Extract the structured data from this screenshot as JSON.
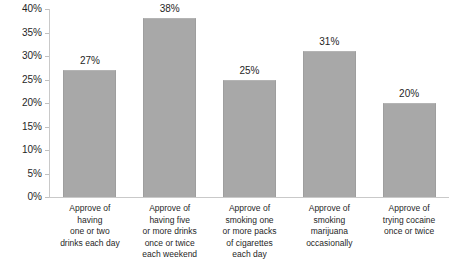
{
  "chart_data": {
    "type": "bar",
    "title": "",
    "xlabel": "",
    "ylabel": "",
    "ylim": [
      0,
      40
    ],
    "grid": false,
    "legend": "none",
    "y_ticks": [
      "0%",
      "5%",
      "10%",
      "15%",
      "20%",
      "25%",
      "30%",
      "35%",
      "40%"
    ],
    "y_tick_values": [
      0,
      5,
      10,
      15,
      20,
      25,
      30,
      35,
      40
    ],
    "categories": [
      "Approve of having one or two drinks each day",
      "Approve of having five or more drinks once or twice each weekend",
      "Approve of smoking one or more packs of cigarettes each day",
      "Approve of smoking marijuana occasionally",
      "Approve of trying cocaine once or twice"
    ],
    "category_lines": [
      [
        "Approve of",
        "having",
        "one or two",
        "drinks each day"
      ],
      [
        "Approve of",
        "having five",
        "or more drinks",
        "once or twice",
        "each weekend"
      ],
      [
        "Approve of",
        "smoking one",
        "or more packs",
        "of cigarettes",
        "each day"
      ],
      [
        "Approve of",
        "smoking",
        "marijuana",
        "occasionally"
      ],
      [
        "Approve of",
        "trying cocaine",
        "once or twice"
      ]
    ],
    "values": [
      27,
      38,
      25,
      31,
      20
    ],
    "value_labels": [
      "27%",
      "38%",
      "25%",
      "31%",
      "20%"
    ],
    "bar_color": "#a8a8a8",
    "axis_color": "#c9c9c9",
    "background_color": "#ffffff"
  }
}
